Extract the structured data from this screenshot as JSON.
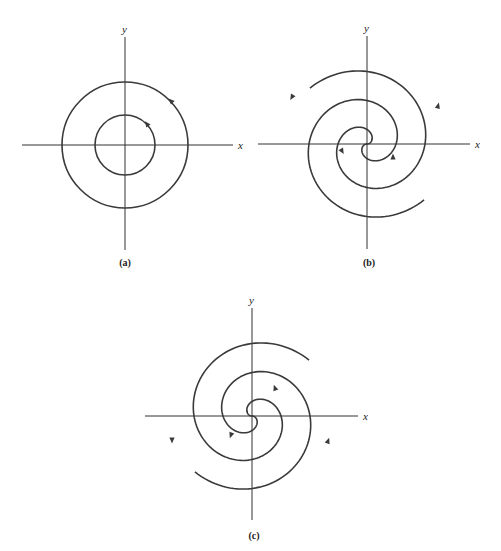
{
  "panels": [
    {
      "id": "a",
      "caption": "(a)",
      "type": "center",
      "x_label": "x",
      "y_label": "y",
      "center": [
        125,
        145
      ],
      "x_axis": [
        22,
        233
      ],
      "y_axis": [
        37,
        250
      ],
      "circles": [
        63,
        30
      ],
      "caption_pos": [
        125,
        266
      ],
      "arrows": [
        {
          "x": 171,
          "y": 101,
          "angle": -135
        },
        {
          "x": 147,
          "y": 124,
          "angle": -125
        }
      ]
    },
    {
      "id": "b",
      "caption": "(b)",
      "type": "spiral",
      "x_label": "x",
      "y_label": "y",
      "center": [
        367,
        144
      ],
      "x_axis": [
        258,
        470
      ],
      "y_axis": [
        36,
        249
      ],
      "k": 9.23,
      "theta_max": 8.66,
      "mirror": false,
      "caption_pos": [
        369,
        266
      ],
      "arrows": [
        {
          "x": 292,
          "y": 97,
          "angle": 120
        },
        {
          "x": 438,
          "y": 106,
          "angle": -75
        },
        {
          "x": 342,
          "y": 151,
          "angle": 60
        },
        {
          "x": 393,
          "y": 157,
          "angle": -90
        }
      ]
    },
    {
      "id": "c",
      "caption": "(c)",
      "type": "spiral",
      "x_label": "x",
      "y_label": "y",
      "center": [
        252,
        416
      ],
      "x_axis": [
        145,
        358
      ],
      "y_axis": [
        308,
        520
      ],
      "k": 9.23,
      "theta_max": 8.66,
      "mirror": true,
      "caption_pos": [
        254,
        539
      ],
      "arrows": [
        {
          "x": 172,
          "y": 440,
          "angle": 90
        },
        {
          "x": 328,
          "y": 441,
          "angle": -70
        },
        {
          "x": 275,
          "y": 388,
          "angle": -110
        },
        {
          "x": 231,
          "y": 435,
          "angle": 110
        }
      ]
    }
  ]
}
